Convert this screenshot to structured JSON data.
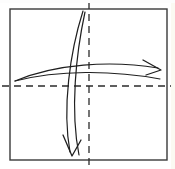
{
  "figure": {
    "canvas": {
      "width": 175,
      "height": 169,
      "background": "#ffffff"
    },
    "frame": {
      "name": "bounding-square",
      "x": 10,
      "y": 9,
      "width": 157,
      "height": 151,
      "stroke": "#3a3a3a",
      "stroke_width": 1.4
    },
    "axes": {
      "horizontal": {
        "label": "horizontal-dashed-axis",
        "y": 86,
        "x_start": 2,
        "x_end": 173,
        "stroke": "#2b2b2b",
        "dash": "7 5"
      },
      "vertical": {
        "label": "vertical-dashed-axis",
        "x": 89,
        "y_start": 2,
        "y_end": 167,
        "stroke": "#2b2b2b",
        "dash": "7 5"
      }
    },
    "curves": [
      {
        "name": "horizontal-flow-upper",
        "path": "M 15 81 C 55 64, 110 60, 158 68",
        "stroke": "#1f1f1f",
        "stroke_width": 1.2,
        "direction": "left-to-right"
      },
      {
        "name": "horizontal-flow-lower",
        "path": "M 15 81 C 58 70, 112 70, 160 79",
        "stroke": "#1f1f1f",
        "stroke_width": 1.2,
        "direction": "left-to-right"
      },
      {
        "name": "vertical-flow-left",
        "path": "M 83 11 C 70 52, 62 108, 70 152",
        "stroke": "#1f1f1f",
        "stroke_width": 1.2,
        "direction": "top-to-bottom"
      },
      {
        "name": "vertical-flow-right",
        "path": "M 85 12 C 76 54, 70 110, 79 155",
        "stroke": "#1f1f1f",
        "stroke_width": 1.2,
        "direction": "top-to-bottom"
      }
    ],
    "arrowheads": [
      {
        "name": "right-arrowhead",
        "tip_x": 160,
        "tip_y": 71,
        "points_toward": "right",
        "path": "M 143 60 L 161 70 L 146 75",
        "stroke": "#1f1f1f",
        "stroke_width": 1.3
      },
      {
        "name": "down-arrowhead",
        "tip_x": 72,
        "tip_y": 156,
        "points_toward": "down",
        "path": "M 63 135 L 72 156 L 81 140",
        "stroke": "#1f1f1f",
        "stroke_width": 1.3
      }
    ],
    "quadrants": {
      "top_left": "contains-converging-curve-origins",
      "top_right": "contains-rightward-sweep",
      "bottom_left": "contains-downward-sweep",
      "bottom_right": "empty"
    }
  }
}
